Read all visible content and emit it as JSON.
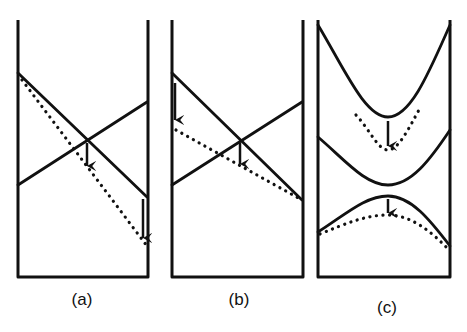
{
  "figure": {
    "panels": [
      {
        "id": "a",
        "label": "(a)",
        "description": "Two crossing straight levels; dotted line shifted downward, arrows at crossing and at right end"
      },
      {
        "id": "b",
        "label": "(b)",
        "description": "Two crossing straight levels; dotted line shifted downward at left, arrows at left end and at crossing"
      },
      {
        "id": "c",
        "label": "(c)",
        "description": "Three curved levels (avoided crossings); dotted curves shifted downward, arrows at minimum and maximum"
      }
    ],
    "colors": {
      "line": "#111111",
      "background": "#ffffff"
    }
  }
}
